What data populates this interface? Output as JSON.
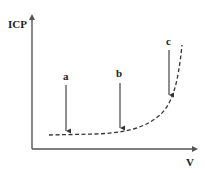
{
  "diagram": {
    "y_axis_label": "ICP",
    "x_axis_label": "V",
    "points": [
      {
        "label": "a"
      },
      {
        "label": "b"
      },
      {
        "label": "c"
      }
    ],
    "colors": {
      "axis": "#555555",
      "curve": "#333333",
      "arrow": "#444444"
    }
  }
}
